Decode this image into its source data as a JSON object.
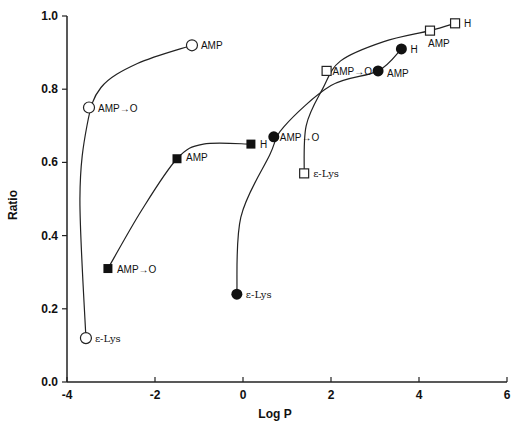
{
  "chart_data": {
    "type": "scatter",
    "title": "",
    "xlabel": "Log P",
    "ylabel": "Ratio",
    "xlim": [
      -4,
      6
    ],
    "ylim": [
      0.0,
      1.0
    ],
    "xticks": [
      "-4",
      "-2",
      "0",
      "2",
      "4",
      "6"
    ],
    "yticks": [
      "0.0",
      "0.2",
      "0.4",
      "0.6",
      "0.8",
      "1.0"
    ],
    "grid": false,
    "legend": null,
    "series": [
      {
        "name": "open-circles",
        "marker": "open-circle",
        "points": [
          {
            "label": "ε-Lys",
            "x": -3.57,
            "y": 0.12
          },
          {
            "label": "AMP→O",
            "x": -3.5,
            "y": 0.75
          },
          {
            "label": "AMP",
            "x": -1.16,
            "y": 0.92
          }
        ]
      },
      {
        "name": "filled-squares",
        "marker": "filled-square",
        "points": [
          {
            "label": "AMP→O",
            "x": -3.07,
            "y": 0.31
          },
          {
            "label": "AMP",
            "x": -1.5,
            "y": 0.61
          },
          {
            "label": "H",
            "x": 0.18,
            "y": 0.65
          }
        ]
      },
      {
        "name": "filled-circles",
        "marker": "filled-circle",
        "points": [
          {
            "label": "ε-Lys",
            "x": -0.14,
            "y": 0.24
          },
          {
            "label": "AMP→O",
            "x": 0.7,
            "y": 0.67
          },
          {
            "label": "AMP",
            "x": 3.07,
            "y": 0.85
          },
          {
            "label": "H",
            "x": 3.6,
            "y": 0.91
          }
        ]
      },
      {
        "name": "open-squares",
        "marker": "open-square",
        "points": [
          {
            "label": "ε-Lys",
            "x": 1.39,
            "y": 0.57
          },
          {
            "label": "AMP→O",
            "x": 1.9,
            "y": 0.85
          },
          {
            "label": "AMP",
            "x": 4.25,
            "y": 0.96
          },
          {
            "label": "H",
            "x": 4.82,
            "y": 0.98
          }
        ]
      }
    ]
  }
}
